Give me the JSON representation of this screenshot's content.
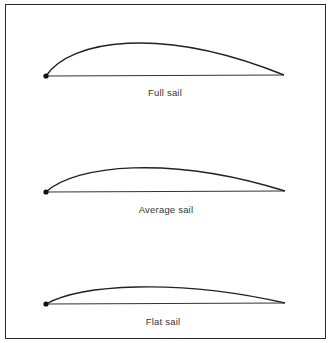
{
  "diagram": {
    "sails": [
      {
        "label": "Full sail",
        "dot": [
          46,
          76
        ],
        "end": [
          284,
          75
        ],
        "control1": [
          70,
          40
        ],
        "control2": [
          160,
          25
        ],
        "label_y": 88
      },
      {
        "label": "Average sail",
        "dot": [
          46,
          192
        ],
        "end": [
          285,
          191
        ],
        "control1": [
          75,
          165
        ],
        "control2": [
          170,
          155
        ],
        "label_y": 205
      },
      {
        "label": "Flat sail",
        "dot": [
          46,
          304
        ],
        "end": [
          285,
          303
        ],
        "control1": [
          80,
          285
        ],
        "control2": [
          175,
          278
        ],
        "label_y": 316
      }
    ],
    "colors": {
      "line": "#222222",
      "text": "#333333",
      "frame": "#2a2a2a"
    }
  }
}
